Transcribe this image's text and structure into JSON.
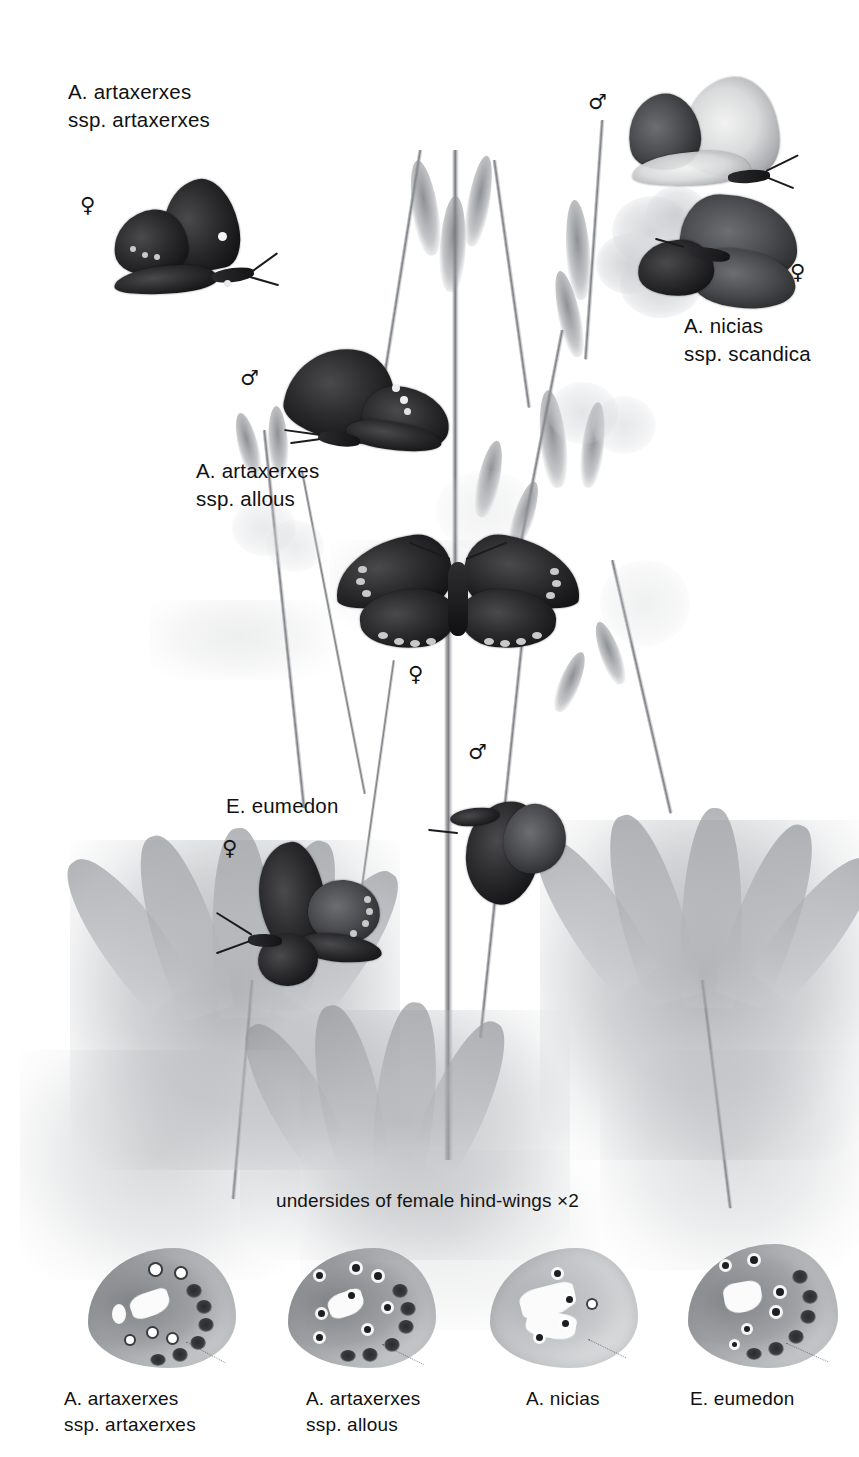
{
  "plate": {
    "title": "Aricia / Eumedon butterfly plate",
    "background_color": "#ffffff",
    "ink_color": "#111111",
    "width_px": 859,
    "height_px": 1457
  },
  "labels": [
    {
      "id": "artaxerxes-artaxerxes",
      "line1": "A. artaxerxes",
      "line2": "ssp. artaxerxes",
      "sex_symbol": "♀",
      "sex": "female"
    },
    {
      "id": "nicias-scandica",
      "line1": "A. nicias",
      "line2": "ssp. scandica",
      "sex_symbol_male": "♂",
      "sex_symbol_female": "♀"
    },
    {
      "id": "artaxerxes-allous",
      "line1": "A. artaxerxes",
      "line2": "ssp. allous",
      "sex_symbol": "♂",
      "sex": "male"
    },
    {
      "id": "eumedon",
      "line1": "E. eumedon",
      "line2": "",
      "sex_symbol_female": "♀",
      "sex_symbol_male": "♂"
    }
  ],
  "center_figure": {
    "sex_symbol": "♀"
  },
  "caption": {
    "text": "undersides of female hind-wings ×2"
  },
  "underside_row": [
    {
      "line1": "A. artaxerxes",
      "line2": "ssp. artaxerxes"
    },
    {
      "line1": "A. artaxerxes",
      "line2": "ssp. allous"
    },
    {
      "line1": "A. nicias",
      "line2": ""
    },
    {
      "line1": "E. eumedon",
      "line2": ""
    }
  ]
}
